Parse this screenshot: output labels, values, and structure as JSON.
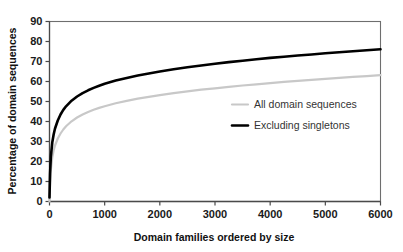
{
  "chart_data": {
    "type": "line",
    "title": "",
    "xlabel": "Domain families ordered by size",
    "ylabel": "Percentage of domain sequences",
    "xlim": [
      0,
      6000
    ],
    "ylim": [
      0,
      90
    ],
    "xticks": [
      0,
      1000,
      2000,
      3000,
      4000,
      5000,
      6000
    ],
    "yticks": [
      0,
      10,
      20,
      30,
      40,
      50,
      60,
      70,
      80,
      90
    ],
    "xtick_labels": [
      "0",
      "1000",
      "2000",
      "3000",
      "4000",
      "5000",
      "6000"
    ],
    "ytick_labels": [
      "0",
      "10",
      "20",
      "30",
      "40",
      "50",
      "60",
      "70",
      "80",
      "90"
    ],
    "grid": false,
    "legend_position": "center-right",
    "x": [
      0,
      10,
      25,
      50,
      75,
      100,
      150,
      200,
      250,
      300,
      400,
      500,
      600,
      700,
      800,
      900,
      1000,
      1200,
      1400,
      1600,
      1800,
      2000,
      2250,
      2500,
      2750,
      3000,
      3250,
      3500,
      3750,
      4000,
      4250,
      4500,
      4750,
      5000,
      5250,
      5500,
      5750,
      6000
    ],
    "series": [
      {
        "name": "All domain sequences",
        "color": "#c8c8c8",
        "linewidth": 2.2,
        "values": [
          0,
          9.5,
          16.0,
          22.0,
          25.5,
          28.0,
          31.5,
          34.0,
          36.0,
          37.6,
          40.1,
          42.0,
          43.5,
          44.8,
          45.9,
          46.8,
          47.6,
          49.1,
          50.3,
          51.4,
          52.3,
          53.2,
          54.2,
          55.1,
          55.9,
          56.6,
          57.3,
          58.0,
          58.6,
          59.2,
          59.8,
          60.3,
          60.8,
          61.3,
          61.8,
          62.3,
          62.7,
          63.2
        ]
      },
      {
        "name": "Excluding singletons",
        "color": "#000000",
        "linewidth": 2.6,
        "values": [
          2.0,
          14.0,
          22.5,
          29.5,
          33.5,
          36.5,
          40.5,
          43.5,
          45.8,
          47.6,
          50.4,
          52.5,
          54.2,
          55.6,
          56.8,
          57.9,
          58.9,
          60.5,
          61.8,
          63.0,
          64.0,
          65.0,
          66.1,
          67.1,
          68.0,
          68.9,
          69.7,
          70.4,
          71.1,
          71.8,
          72.4,
          73.0,
          73.5,
          74.1,
          74.6,
          75.1,
          75.6,
          76.1
        ]
      }
    ],
    "legend_entries": [
      {
        "label": "All domain sequences",
        "color": "#c8c8c8"
      },
      {
        "label": "Excluding singletons",
        "color": "#000000"
      }
    ]
  }
}
